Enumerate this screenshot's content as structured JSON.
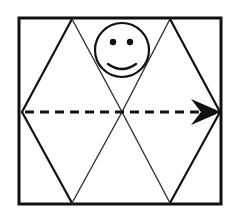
{
  "diagram": {
    "colors": {
      "background": "#ffffff",
      "stroke": "#111111",
      "thin_stroke": "#333333"
    },
    "square": {
      "x": 19,
      "y": 18,
      "width": 202,
      "height": 186
    },
    "hexagon": {
      "vertices": [
        [
          22,
          112
        ],
        [
          72,
          19
        ],
        [
          170,
          19
        ],
        [
          220,
          112
        ],
        [
          170,
          203
        ],
        [
          72,
          203
        ]
      ],
      "center": [
        122,
        112
      ]
    },
    "smiley": {
      "icon": "smiley-face-icon",
      "center": [
        122,
        50
      ],
      "radius": 27
    },
    "arrow": {
      "icon": "dashed-arrow-right-icon",
      "direction": "right",
      "start": [
        24,
        112
      ],
      "end": [
        220,
        112
      ],
      "dash_pattern": "9 6"
    }
  }
}
